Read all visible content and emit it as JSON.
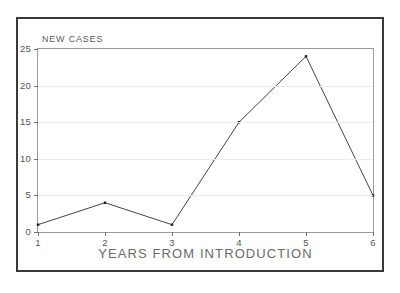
{
  "figure": {
    "y_axis_title": "NEW CASES",
    "x_axis_title": "YEARS FROM INTRODUCTION",
    "line_color": "#444444",
    "marker_color": "#1a1a1a",
    "frame_color": "#3a3a3a",
    "plot_border_color": "#9a9a9a",
    "grid_color": "#ececec",
    "tick_label_color": "#555555",
    "background_color": "#ffffff"
  },
  "chart_data": {
    "type": "line",
    "title": "",
    "xlabel": "YEARS FROM INTRODUCTION",
    "ylabel": "NEW CASES",
    "x": [
      1,
      2,
      3,
      4,
      5,
      6
    ],
    "values": [
      1,
      4,
      1,
      15,
      24,
      5
    ],
    "series": [
      {
        "name": "NEW CASES",
        "values": [
          1,
          4,
          1,
          15,
          24,
          5
        ]
      }
    ],
    "xlim": [
      1,
      6
    ],
    "ylim": [
      0,
      25
    ],
    "xticks": [
      1,
      2,
      3,
      4,
      5,
      6
    ],
    "yticks": [
      0,
      5,
      10,
      15,
      20,
      25
    ],
    "xtick_labels": [
      "1",
      "2",
      "3",
      "4",
      "5",
      "6"
    ],
    "ytick_labels": [
      "0",
      "5",
      "10",
      "15",
      "20",
      "25"
    ],
    "grid": true,
    "grid_axis": "y",
    "legend": false,
    "legend_position": "none",
    "markers": "square-dot",
    "annotations": []
  }
}
